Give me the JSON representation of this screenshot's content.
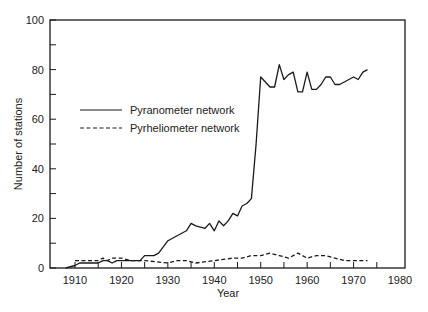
{
  "chart_data": {
    "type": "line",
    "title": "",
    "xlabel": "Year",
    "ylabel": "Number of stations",
    "xlim": [
      1905,
      1980
    ],
    "ylim": [
      0,
      100
    ],
    "xticks": [
      1910,
      1920,
      1930,
      1940,
      1950,
      1960,
      1970,
      1980
    ],
    "yticks": [
      0,
      20,
      40,
      60,
      80,
      100
    ],
    "grid": false,
    "legend_position": "upper-left-inside",
    "series": [
      {
        "name": "Pyranometer network",
        "style": "solid",
        "x": [
          1908,
          1910,
          1911,
          1915,
          1916,
          1917,
          1918,
          1919,
          1920,
          1924,
          1925,
          1927,
          1928,
          1930,
          1932,
          1933,
          1934,
          1935,
          1936,
          1938,
          1939,
          1940,
          1941,
          1942,
          1943,
          1944,
          1945,
          1946,
          1947,
          1948,
          1949,
          1950,
          1951,
          1952,
          1953,
          1954,
          1955,
          1956,
          1957,
          1958,
          1959,
          1960,
          1961,
          1962,
          1963,
          1964,
          1965,
          1966,
          1967,
          1968,
          1969,
          1970,
          1971,
          1972,
          1973
        ],
        "values": [
          0,
          1,
          2,
          2,
          3,
          3,
          2,
          3,
          3,
          3,
          5,
          5,
          6,
          11,
          13,
          14,
          15,
          18,
          17,
          16,
          18,
          15,
          19,
          17,
          19,
          22,
          21,
          25,
          26,
          28,
          50,
          77,
          75,
          73,
          73,
          82,
          76,
          78,
          79,
          71,
          71,
          79,
          72,
          72,
          74,
          77,
          77,
          74,
          74,
          75,
          76,
          77,
          76,
          79,
          80
        ],
        "note": "trailing value approx; series ends ~1973"
      },
      {
        "name": "Pyrheliometer network",
        "style": "dashed",
        "x": [
          1910,
          1915,
          1916,
          1917,
          1918,
          1920,
          1922,
          1925,
          1930,
          1932,
          1934,
          1936,
          1940,
          1944,
          1946,
          1948,
          1950,
          1952,
          1954,
          1956,
          1958,
          1960,
          1962,
          1964,
          1966,
          1968,
          1970,
          1973
        ],
        "values": [
          3,
          3,
          4,
          3,
          4,
          4,
          3,
          3,
          2,
          3,
          3,
          2,
          3,
          4,
          4,
          5,
          5,
          6,
          5,
          4,
          6,
          4,
          5,
          5,
          4,
          3,
          3,
          3
        ]
      }
    ]
  },
  "legend": {
    "items": [
      {
        "label": "Pyranometer network",
        "style": "solid"
      },
      {
        "label": "Pyrheliometer network",
        "style": "dashed"
      }
    ]
  },
  "axes": {
    "xlabel": "Year",
    "ylabel": "Number of stations",
    "xtick_labels": [
      "1910",
      "1920",
      "1930",
      "1940",
      "1950",
      "1960",
      "1970",
      "1980"
    ],
    "ytick_labels": [
      "0",
      "20",
      "40",
      "60",
      "80",
      "100"
    ]
  },
  "colors": {
    "line": "#1a1a1a",
    "axis": "#1a1a1a",
    "background": "#ffffff"
  }
}
